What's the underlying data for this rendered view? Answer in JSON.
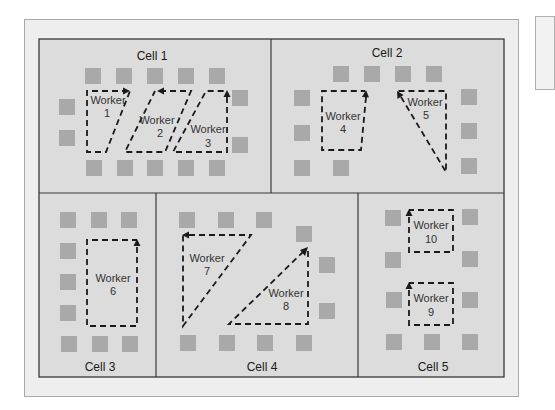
{
  "diagram": {
    "type": "cellular-layout",
    "cells": [
      {
        "id": 1,
        "label": "Cell 1",
        "label_pos": [
          152,
          56
        ]
      },
      {
        "id": 2,
        "label": "Cell 2",
        "label_pos": [
          387,
          56
        ]
      },
      {
        "id": 3,
        "label": "Cell 3",
        "label_pos": [
          100,
          370
        ]
      },
      {
        "id": 4,
        "label": "Cell 4",
        "label_pos": [
          262,
          370
        ]
      },
      {
        "id": 5,
        "label": "Cell 5",
        "label_pos": [
          438,
          370
        ]
      }
    ],
    "workers": [
      {
        "id": 1,
        "word": "Worker",
        "number": "1",
        "cell": 1
      },
      {
        "id": 2,
        "word": "Worker",
        "number": "2",
        "cell": 1
      },
      {
        "id": 3,
        "word": "Worker",
        "number": "3",
        "cell": 1
      },
      {
        "id": 4,
        "word": "Worker",
        "number": "4",
        "cell": 2
      },
      {
        "id": 5,
        "word": "Worker",
        "number": "5",
        "cell": 2
      },
      {
        "id": 6,
        "word": "Worker",
        "number": "6",
        "cell": 3
      },
      {
        "id": 7,
        "word": "Worker",
        "number": "7",
        "cell": 4
      },
      {
        "id": 8,
        "word": "Worker",
        "number": "8",
        "cell": 4
      },
      {
        "id": 9,
        "word": "Worker",
        "number": "9",
        "cell": 5
      },
      {
        "id": 10,
        "word": "Worker",
        "number": "10",
        "cell": 5
      }
    ],
    "colors": {
      "cell_fill": "#dcdcdc",
      "machine_fill": "#a9a9a9",
      "path_stroke": "#1a1a1a",
      "frame_fill": "#eeeeee"
    }
  }
}
